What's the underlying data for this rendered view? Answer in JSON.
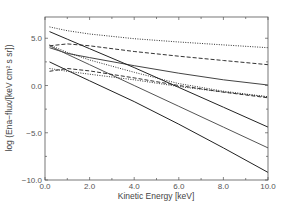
{
  "chart_data": {
    "type": "line",
    "title": "",
    "xlabel": "Kinetic Energy [keV]",
    "ylabel": "log (Ena−flux/[keV cm² s sr])",
    "xlim": [
      0,
      10
    ],
    "ylim": [
      -10,
      7.25
    ],
    "grid": false,
    "legend": "none",
    "x_ticks": [
      "0.0",
      "2.0",
      "4.0",
      "6.0",
      "8.0",
      "10.0"
    ],
    "y_ticks": [
      "5.0",
      "0.0",
      "-5.0",
      "-10.0"
    ],
    "x": [
      0.2,
      1,
      2,
      4,
      6,
      8,
      10
    ],
    "series": [
      {
        "name": "dotted-top",
        "style": "dotted",
        "values": [
          6.2,
          5.8,
          5.45,
          4.95,
          4.6,
          4.3,
          4.0
        ]
      },
      {
        "name": "dashed-upper",
        "style": "dashed",
        "values": [
          4.2,
          4.4,
          4.2,
          3.6,
          3.1,
          2.65,
          2.2
        ]
      },
      {
        "name": "solid-curved",
        "style": "solid",
        "values": [
          4.0,
          3.4,
          2.95,
          2.1,
          1.3,
          0.6,
          0.05
        ]
      },
      {
        "name": "solid-thick-top",
        "style": "solid",
        "values": [
          5.7,
          4.9,
          3.9,
          1.9,
          -0.2,
          -2.3,
          -4.4
        ]
      },
      {
        "name": "solid-gray",
        "style": "solid",
        "values": [
          4.2,
          3.3,
          2.2,
          0.0,
          -2.2,
          -4.4,
          -6.6
        ]
      },
      {
        "name": "dotted-upper-mid",
        "style": "dotted",
        "values": [
          4.3,
          3.5,
          2.7,
          1.4,
          0.2,
          -0.6,
          -1.2
        ]
      },
      {
        "name": "solid-bottom",
        "style": "solid",
        "values": [
          2.5,
          1.6,
          0.5,
          -1.7,
          -4.1,
          -6.6,
          -9.2
        ]
      },
      {
        "name": "dashed-lower",
        "style": "dashed",
        "values": [
          1.5,
          1.8,
          1.55,
          0.8,
          0.0,
          -0.7,
          -1.3
        ]
      },
      {
        "name": "dotted-lower",
        "style": "dotted",
        "values": [
          1.8,
          1.5,
          1.2,
          0.6,
          -0.1,
          -0.7,
          -1.2
        ]
      }
    ]
  }
}
